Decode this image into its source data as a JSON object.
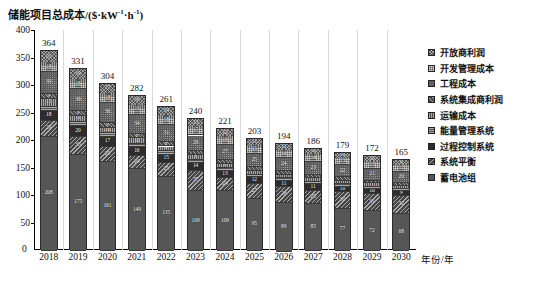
{
  "chart_data": {
    "type": "bar",
    "subtype": "stacked-bar",
    "title_main": "储能项目总成本/($·kW",
    "title_sup1": "-1",
    "title_mid": "·h",
    "title_sup2": "-1",
    "title_end": ")",
    "xlabel": "年份/年",
    "ylabel": "储能项目总成本/($·kW⁻¹·h⁻¹)",
    "ylim": [
      0,
      400
    ],
    "yticks": [
      0,
      50,
      100,
      150,
      200,
      250,
      300,
      350,
      400
    ],
    "ytick_labels": [
      "0",
      "50",
      "100",
      "150",
      "200",
      "250",
      "300",
      "350",
      "400"
    ],
    "grid": false,
    "legend_position": "right",
    "categories": [
      "2018",
      "2019",
      "2020",
      "2021",
      "2022",
      "2023",
      "2024",
      "2025",
      "2026",
      "2027",
      "2028",
      "2029",
      "2030"
    ],
    "totals": [
      364,
      331,
      304,
      282,
      261,
      240,
      221,
      203,
      194,
      186,
      179,
      172,
      165
    ],
    "series": [
      {
        "name": "开放商利润",
        "pattern": "crosshatch",
        "values": [
          21,
          19,
          17,
          16,
          14,
          13,
          12,
          11,
          11,
          10,
          10,
          10,
          9
        ]
      },
      {
        "name": "开发管理成本",
        "pattern": "grid",
        "values": [
          18,
          18,
          18,
          19,
          18,
          17,
          16,
          15,
          14,
          14,
          13,
          13,
          12
        ]
      },
      {
        "name": "工程成本",
        "pattern": "dots",
        "values": [
          39,
          39,
          36,
          34,
          31,
          29,
          27,
          25,
          24,
          23,
          22,
          21,
          20
        ]
      },
      {
        "name": "系统集成商利润",
        "pattern": "diag-left",
        "values": [
          9,
          9,
          9,
          8,
          8,
          7,
          7,
          6,
          6,
          6,
          6,
          5,
          5
        ]
      },
      {
        "name": "运输成本",
        "pattern": "vertical",
        "values": [
          15,
          11,
          10,
          10,
          9,
          8,
          8,
          7,
          7,
          7,
          6,
          6,
          6
        ]
      },
      {
        "name": "能量管理系统",
        "pattern": "horizontal",
        "values": [
          7,
          7,
          7,
          6,
          6,
          6,
          5,
          5,
          5,
          5,
          5,
          4,
          4
        ]
      },
      {
        "name": "过程控制系统",
        "pattern": "solid-dark",
        "values": [
          18,
          20,
          17,
          16,
          15,
          14,
          13,
          12,
          11,
          11,
          10,
          10,
          9
        ]
      },
      {
        "name": "系统平衡",
        "pattern": "diag-right",
        "values": [
          29,
          33,
          29,
          24,
          25,
          37,
          24,
          27,
          28,
          25,
          30,
          31,
          32
        ]
      },
      {
        "name": "蓄电池组",
        "pattern": "solid-gray",
        "values": [
          208,
          175,
          161,
          149,
          135,
          109,
          109,
          95,
          89,
          85,
          77,
          72,
          68
        ]
      }
    ]
  },
  "legend": {
    "items": [
      {
        "label": "开放商利润"
      },
      {
        "label": "开发管理成本"
      },
      {
        "label": "工程成本"
      },
      {
        "label": "系统集成商利润"
      },
      {
        "label": "运输成本"
      },
      {
        "label": "能量管理系统"
      },
      {
        "label": "过程控制系统"
      },
      {
        "label": "系统平衡"
      },
      {
        "label": "蓄电池组"
      }
    ]
  },
  "axes": {
    "zero_label": "0",
    "x_axis_title": "年份/年"
  }
}
